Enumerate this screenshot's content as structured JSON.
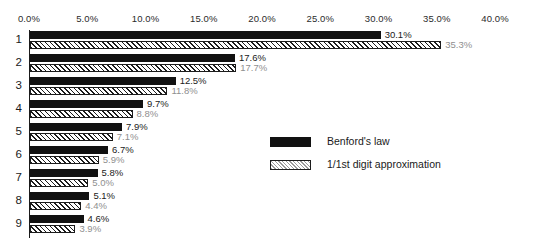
{
  "chart_data": {
    "type": "bar",
    "orientation": "horizontal",
    "title": "",
    "xlabel": "",
    "ylabel": "",
    "xlim": [
      0,
      40
    ],
    "grid": false,
    "legend_position": "center-right",
    "categories": [
      "1",
      "2",
      "3",
      "4",
      "5",
      "6",
      "7",
      "8",
      "9"
    ],
    "xticks": [
      "0.0%",
      "5.0%",
      "10.0%",
      "15.0%",
      "20.0%",
      "25.0%",
      "30.0%",
      "35.0%",
      "40.0%"
    ],
    "xtick_values": [
      0,
      5,
      10,
      15,
      20,
      25,
      30,
      35,
      40
    ],
    "series": [
      {
        "name": "Benford's law",
        "pattern": "solid-black",
        "color": "#111111",
        "values": [
          30.1,
          17.6,
          12.5,
          9.7,
          7.9,
          6.7,
          5.8,
          5.1,
          4.6
        ],
        "labels": [
          "30.1%",
          "17.6%",
          "12.5%",
          "9.7%",
          "7.9%",
          "6.7%",
          "5.8%",
          "5.1%",
          "4.6%"
        ]
      },
      {
        "name": "1/1st digit approximation",
        "pattern": "diagonal-hatch",
        "color": "#ffffff",
        "label_color": "#8f8f8f",
        "values": [
          35.3,
          17.7,
          11.8,
          8.8,
          7.1,
          5.9,
          5.0,
          4.4,
          3.9
        ],
        "labels": [
          "35.3%",
          "17.7%",
          "11.8%",
          "8.8%",
          "7.1%",
          "5.9%",
          "5.0%",
          "4.4%",
          "3.9%"
        ]
      }
    ]
  }
}
